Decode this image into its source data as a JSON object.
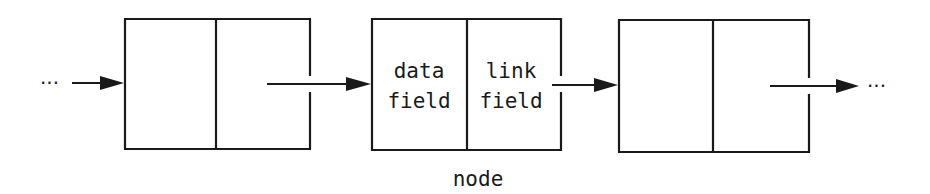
{
  "diagram": {
    "type": "linked-list",
    "leading_ellipsis": "···",
    "trailing_ellipsis": "···",
    "nodes": [
      {
        "id": "node-1",
        "data_label": "",
        "link_label": ""
      },
      {
        "id": "node-2",
        "data_label_line1": "data",
        "data_label_line2": "field",
        "link_label_line1": "link",
        "link_label_line2": "field",
        "caption": "node"
      },
      {
        "id": "node-3",
        "data_label": "",
        "link_label": ""
      }
    ],
    "colors": {
      "stroke": "#1a1a1a",
      "background": "#ffffff"
    }
  }
}
